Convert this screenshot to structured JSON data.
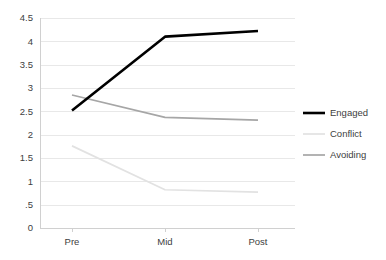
{
  "chart_data": {
    "type": "line",
    "title": "",
    "xlabel": "",
    "ylabel": "",
    "categories": [
      "Pre",
      "Mid",
      "Post"
    ],
    "ylim": [
      0,
      4.5
    ],
    "yticks": [
      0,
      0.5,
      1,
      1.5,
      2,
      2.5,
      3,
      3.5,
      4,
      4.5
    ],
    "ytick_labels": [
      "0",
      ".5",
      "1",
      "1.5",
      "2",
      "2.5",
      "3",
      "3.5",
      "4",
      "4.5"
    ],
    "xtick_labels": [
      "Pre",
      "Mid",
      "Post"
    ],
    "grid": true,
    "legend_position": "right",
    "series": [
      {
        "name": "Engaged",
        "values": [
          2.52,
          4.1,
          4.22
        ],
        "color": "#000000",
        "width": 2.6
      },
      {
        "name": "Conflict",
        "values": [
          1.76,
          0.82,
          0.77
        ],
        "color": "#e2e2e2",
        "width": 1.7
      },
      {
        "name": "Avoiding",
        "values": [
          2.85,
          2.37,
          2.31
        ],
        "color": "#a6a6a6",
        "width": 1.7
      }
    ]
  },
  "legend": {
    "items": [
      {
        "label": "Engaged"
      },
      {
        "label": "Conflict"
      },
      {
        "label": "Avoiding"
      }
    ]
  },
  "axes": {
    "y": {
      "labels": [
        "4.5",
        "4",
        "3.5",
        "3",
        "2.5",
        "2",
        "1.5",
        "1",
        ".5",
        "0"
      ]
    },
    "x": {
      "labels": [
        "Pre",
        "Mid",
        "Post"
      ]
    }
  },
  "colors": {
    "gridline": "#e8e8e8",
    "axis": "#d0d0d0",
    "text": "#404040",
    "background": "#ffffff",
    "engaged": "#000000",
    "conflict": "#e2e2e2",
    "avoiding": "#a6a6a6"
  }
}
